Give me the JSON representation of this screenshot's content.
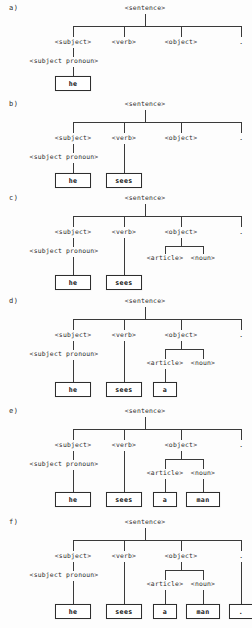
{
  "figure": {
    "grammar_nodes": {
      "sentence": "<sentence>",
      "subject": "<subject>",
      "verb": "<verb>",
      "object": "<object>",
      "subject_pronoun": "<subject pronoun>",
      "article": "<article>",
      "noun": "<noun>",
      "period": "."
    },
    "terminals": {
      "he": "he",
      "sees": "sees",
      "a": "a",
      "man": "man",
      "dot": "."
    },
    "panels": [
      {
        "id": "a",
        "label": "a)",
        "root": "<sentence>",
        "children": [
          "<subject>",
          "<verb>",
          "<object>",
          "."
        ],
        "expanded": [
          "<subject pronoun>"
        ],
        "terminals": [
          "he"
        ]
      },
      {
        "id": "b",
        "label": "b)",
        "root": "<sentence>",
        "children": [
          "<subject>",
          "<verb>",
          "<object>",
          "."
        ],
        "expanded": [
          "<subject pronoun>"
        ],
        "terminals": [
          "he",
          "sees"
        ]
      },
      {
        "id": "c",
        "label": "c)",
        "root": "<sentence>",
        "children": [
          "<subject>",
          "<verb>",
          "<object>",
          "."
        ],
        "expanded": [
          "<subject pronoun>",
          "<article>",
          "<noun>"
        ],
        "terminals": [
          "he",
          "sees"
        ]
      },
      {
        "id": "d",
        "label": "d)",
        "root": "<sentence>",
        "children": [
          "<subject>",
          "<verb>",
          "<object>",
          "."
        ],
        "expanded": [
          "<subject pronoun>",
          "<article>",
          "<noun>"
        ],
        "terminals": [
          "he",
          "sees",
          "a"
        ]
      },
      {
        "id": "e",
        "label": "e)",
        "root": "<sentence>",
        "children": [
          "<subject>",
          "<verb>",
          "<object>",
          "."
        ],
        "expanded": [
          "<subject pronoun>",
          "<article>",
          "<noun>"
        ],
        "terminals": [
          "he",
          "sees",
          "a",
          "man"
        ]
      },
      {
        "id": "f",
        "label": "f)",
        "root": "<sentence>",
        "children": [
          "<subject>",
          "<verb>",
          "<object>",
          "."
        ],
        "expanded": [
          "<subject pronoun>",
          "<article>",
          "<noun>"
        ],
        "terminals": [
          "he",
          "sees",
          "a",
          "man",
          "."
        ]
      }
    ],
    "colors": {
      "ink": "#2b2b2b",
      "line": "#3a3a3a",
      "box_border": "#2e2e2e",
      "background": "#fdfdfd"
    }
  }
}
